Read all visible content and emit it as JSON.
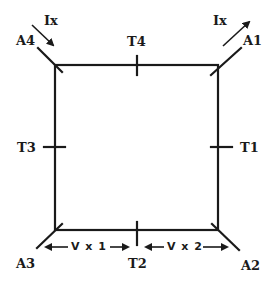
{
  "diagram": {
    "corners": [
      {
        "id": "A1",
        "label": "A1",
        "position": "top-right"
      },
      {
        "id": "A2",
        "label": "A2",
        "position": "bottom-right"
      },
      {
        "id": "A3",
        "label": "A3",
        "position": "bottom-left"
      },
      {
        "id": "A4",
        "label": "A4",
        "position": "top-left"
      }
    ],
    "terminals": [
      {
        "id": "T1",
        "label": "T1",
        "side": "right"
      },
      {
        "id": "T2",
        "label": "T2",
        "side": "bottom"
      },
      {
        "id": "T3",
        "label": "T3",
        "side": "left"
      },
      {
        "id": "T4",
        "label": "T4",
        "side": "top"
      }
    ],
    "currents": [
      {
        "label": "Ix",
        "at": "A4",
        "direction": "in"
      },
      {
        "label": "Ix",
        "at": "A1",
        "direction": "out"
      }
    ],
    "voltages": [
      {
        "label": "V x 1",
        "between": [
          "A3",
          "T2"
        ]
      },
      {
        "label": "V x 2",
        "between": [
          "T2",
          "A2"
        ]
      }
    ],
    "line_color": "#1a1a1a"
  }
}
